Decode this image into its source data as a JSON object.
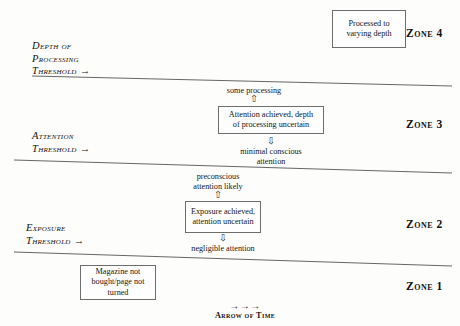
{
  "diagram": {
    "background_color": "#fdfdfc",
    "line_color": "#555555"
  },
  "thresholds": [
    {
      "id": "depth-of-processing",
      "label": "Depth of\nProcessing\nThreshold →"
    },
    {
      "id": "attention",
      "label": "Attention\nThreshold →"
    },
    {
      "id": "exposure",
      "label": "Exposure\nThreshold →"
    }
  ],
  "zones": [
    {
      "id": "zone-4",
      "label": "Zone 4"
    },
    {
      "id": "zone-3",
      "label": "Zone 3"
    },
    {
      "id": "zone-2",
      "label": "Zone 2"
    },
    {
      "id": "zone-1",
      "label": "Zone 1"
    }
  ],
  "boxes": [
    {
      "id": "zone-4-box",
      "text": "Processed to\nvarying depth"
    },
    {
      "id": "zone-3-box",
      "text": "Attention achieved, depth\nof processing uncertain"
    },
    {
      "id": "zone-2-box",
      "text": "Exposure achieved,\nattention uncertain"
    },
    {
      "id": "zone-1-box",
      "text": "Magazine not\nbought/page not\nturned"
    }
  ],
  "captions": [
    {
      "id": "some-processing",
      "text": "some processing"
    },
    {
      "id": "minimal-conscious-attention",
      "text": "minimal conscious\nattention"
    },
    {
      "id": "preconscious-attention-likely",
      "text": "preconscious\nattention likely"
    },
    {
      "id": "negligible-attention",
      "text": "negligible attention"
    }
  ],
  "flow_arrows": [
    {
      "id": "up-arrow-some-processing",
      "glyph": "⇧"
    },
    {
      "id": "down-arrow-minimal-attention",
      "glyph": "⇩"
    },
    {
      "id": "up-arrow-preconscious",
      "glyph": "⇧"
    },
    {
      "id": "down-arrow-negligible",
      "glyph": "⇩"
    }
  ],
  "time_axis": {
    "arrows": "→→→",
    "label": "Arrow of Time"
  }
}
